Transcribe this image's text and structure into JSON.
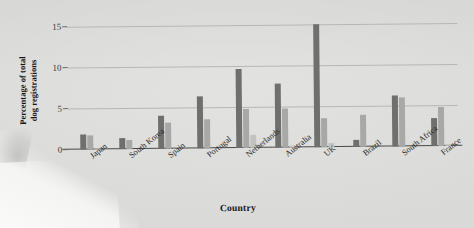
{
  "chart_data": {
    "type": "bar",
    "title": "",
    "xlabel": "Country",
    "ylabel": "Percentage of total dog registrations",
    "ylabel_line1": "Percentage of total",
    "ylabel_line2": "dog registrations",
    "categories": [
      "Japan",
      "South Korea",
      "Spain",
      "Portugal",
      "Netherlands",
      "Australia",
      "UK",
      "Brazil",
      "South Africa",
      "France"
    ],
    "yticks": [
      0,
      5,
      10,
      15
    ],
    "ylim": [
      0,
      15.6
    ],
    "grid": true,
    "legend": "none",
    "series": [
      {
        "name": "series-1",
        "color": "#6f6f6e",
        "values": [
          1.8,
          1.4,
          4.0,
          6.3,
          9.6,
          7.8,
          15.0,
          0.8,
          6.2,
          3.4
        ]
      },
      {
        "name": "series-2",
        "color": "#a8a8a6",
        "values": [
          1.7,
          1.1,
          3.2,
          3.5,
          4.7,
          4.7,
          3.5,
          3.9,
          6.0,
          4.7
        ]
      },
      {
        "name": "series-3",
        "color": "#c2c2c0",
        "values": [
          0.1,
          0.0,
          0.0,
          0.0,
          1.6,
          0.2,
          0.5,
          0.0,
          0.0,
          0.2
        ]
      }
    ]
  }
}
